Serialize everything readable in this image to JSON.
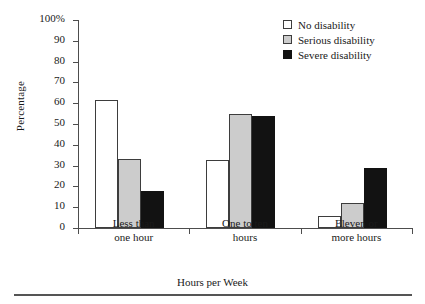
{
  "chart_data": {
    "type": "bar",
    "title": "",
    "xlabel": "Hours per Week",
    "ylabel": "Percentage",
    "categories": [
      "Less than one hour",
      "One to ten hours",
      "Eleven or more hours"
    ],
    "category_lines": [
      [
        "Less than",
        "one hour"
      ],
      [
        "One to ten",
        "hours"
      ],
      [
        "Eleven or",
        "more hours"
      ]
    ],
    "series": [
      {
        "name": "No disability",
        "values": [
          61.5,
          32.5,
          6
        ],
        "color": "#ffffff"
      },
      {
        "name": "Serious disability",
        "values": [
          33,
          55,
          12
        ],
        "color": "#cccccc"
      },
      {
        "name": "Severe disability",
        "values": [
          18,
          54,
          29
        ],
        "color": "#121212"
      }
    ],
    "ylim": [
      0,
      100
    ],
    "ytick_values": [
      0,
      10,
      20,
      30,
      40,
      50,
      60,
      70,
      80,
      90,
      100
    ],
    "ytick_labels": [
      "0",
      "10",
      "20",
      "30",
      "40",
      "50",
      "60",
      "70",
      "80",
      "90",
      "100%"
    ],
    "grid": false,
    "legend_position": "top-right"
  },
  "legend": {
    "items": [
      {
        "label": "No disability",
        "swatch": "white-square-icon"
      },
      {
        "label": "Serious disability",
        "swatch": "gray-square-icon"
      },
      {
        "label": "Severe disability",
        "swatch": "black-square-icon"
      }
    ]
  }
}
